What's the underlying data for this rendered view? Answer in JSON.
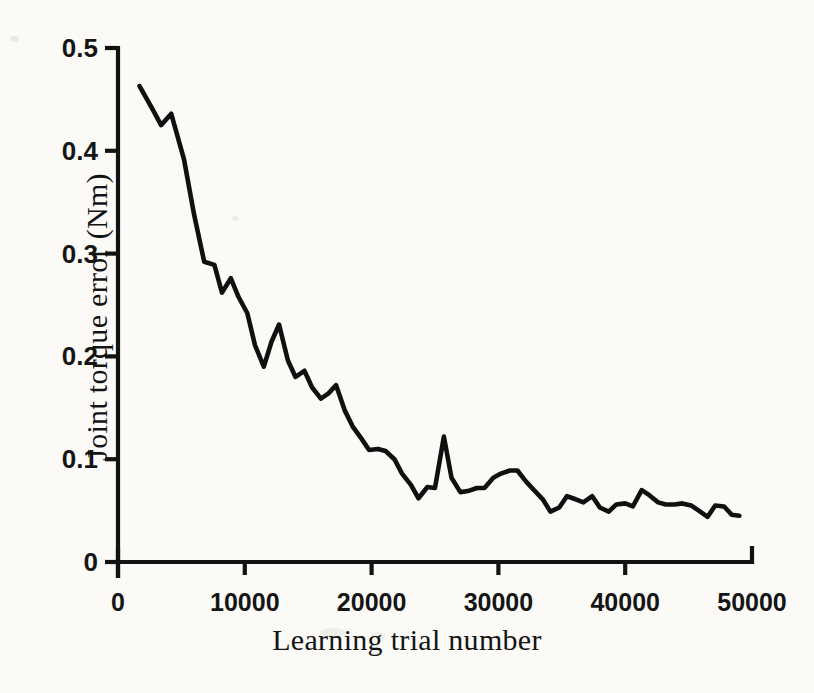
{
  "chart_data": {
    "type": "line",
    "title": "",
    "xlabel": "Learning trial number",
    "ylabel": "Joint torque error (Nm)",
    "xlim": [
      0,
      50000
    ],
    "ylim": [
      0,
      0.5
    ],
    "xticks": [
      0,
      10000,
      20000,
      30000,
      40000,
      50000
    ],
    "xtick_labels": [
      "0",
      "10000",
      "20000",
      "30000",
      "40000",
      "50000"
    ],
    "yticks": [
      0,
      0.1,
      0.2,
      0.3,
      0.4,
      0.5
    ],
    "ytick_labels": [
      "0",
      "0.1",
      "0.2",
      "0.3",
      "0.4",
      "0.5"
    ],
    "grid": false,
    "legend": false,
    "line_color": "#101010",
    "background_color": "#fbfaf7",
    "series": [
      {
        "name": "Joint torque error",
        "x": [
          1700,
          2700,
          3400,
          4200,
          5200,
          6000,
          6800,
          7600,
          8200,
          8900,
          9500,
          10200,
          10800,
          11500,
          12100,
          12700,
          13400,
          14000,
          14700,
          15300,
          16000,
          16600,
          17200,
          17900,
          18500,
          19200,
          19800,
          20500,
          21100,
          21800,
          22400,
          23100,
          23700,
          24400,
          25000,
          25700,
          26300,
          27000,
          27600,
          28300,
          28900,
          29600,
          30200,
          30900,
          31500,
          32200,
          32800,
          33500,
          34100,
          34800,
          35400,
          36100,
          36700,
          37400,
          38000,
          38700,
          39300,
          40000,
          40600,
          41300,
          41900,
          42600,
          43200,
          43900,
          44500,
          45200,
          45800,
          46500,
          47100,
          47800,
          48400,
          49000
        ],
        "y": [
          0.463,
          0.441,
          0.425,
          0.436,
          0.392,
          0.338,
          0.292,
          0.289,
          0.262,
          0.276,
          0.258,
          0.242,
          0.211,
          0.19,
          0.214,
          0.231,
          0.196,
          0.18,
          0.186,
          0.17,
          0.159,
          0.164,
          0.172,
          0.147,
          0.132,
          0.12,
          0.109,
          0.11,
          0.108,
          0.1,
          0.086,
          0.075,
          0.062,
          0.073,
          0.072,
          0.122,
          0.082,
          0.068,
          0.069,
          0.072,
          0.072,
          0.082,
          0.086,
          0.089,
          0.089,
          0.078,
          0.07,
          0.061,
          0.049,
          0.053,
          0.064,
          0.061,
          0.058,
          0.064,
          0.053,
          0.049,
          0.056,
          0.057,
          0.054,
          0.07,
          0.065,
          0.058,
          0.056,
          0.056,
          0.057,
          0.055,
          0.05,
          0.044,
          0.055,
          0.054,
          0.046,
          0.045
        ]
      }
    ]
  },
  "axis": {
    "origin_px": {
      "x": 118,
      "y": 562
    },
    "x_right_px": 752,
    "y_top_px": 48
  }
}
